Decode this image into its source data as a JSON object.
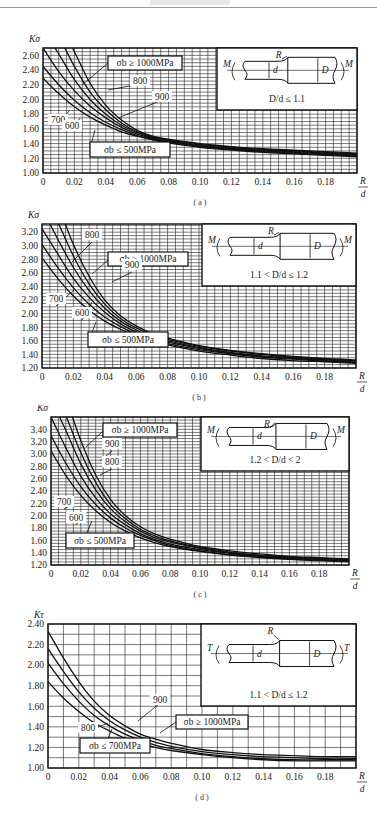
{
  "header": {
    "rule": true
  },
  "chart_data": [
    {
      "id": "a",
      "type": "line",
      "caption": "( a )",
      "ylabel": "Kσ",
      "xlabel": "R/d",
      "xlim": [
        0,
        0.2
      ],
      "ylim": [
        1.0,
        2.7
      ],
      "yticks": [
        "1.00",
        "1.20",
        "1.40",
        "1.60",
        "1.80",
        "2.00",
        "2.20",
        "2.40",
        "2.60"
      ],
      "xticks": [
        "0",
        "0.02",
        "0.04",
        "0.06",
        "0.08",
        "0.10",
        "0.12",
        "0.14",
        "0.16",
        "0.18"
      ],
      "grid": true,
      "inset": {
        "load": "M",
        "condition": "D/d ≤ 1.1"
      },
      "x": [
        0,
        0.01,
        0.02,
        0.03,
        0.04,
        0.05,
        0.06,
        0.07,
        0.08,
        0.1,
        0.12,
        0.14,
        0.16,
        0.18,
        0.2
      ],
      "series": [
        {
          "name": "σb ≤ 500MPa",
          "values": [
            2.29,
            2.08,
            1.9,
            1.76,
            1.65,
            1.56,
            1.5,
            1.45,
            1.41,
            1.35,
            1.31,
            1.28,
            1.26,
            1.24,
            1.22
          ]
        },
        {
          "name": "600",
          "values": [
            2.45,
            2.2,
            1.99,
            1.82,
            1.69,
            1.59,
            1.51,
            1.46,
            1.42,
            1.36,
            1.32,
            1.29,
            1.27,
            1.25,
            1.23
          ]
        },
        {
          "name": "700",
          "values": [
            2.7,
            2.38,
            2.12,
            1.91,
            1.75,
            1.62,
            1.53,
            1.47,
            1.43,
            1.37,
            1.33,
            1.3,
            1.28,
            1.26,
            1.24
          ]
        },
        {
          "name": "800",
          "values": [
            2.95,
            2.62,
            2.27,
            2.0,
            1.8,
            1.65,
            1.55,
            1.48,
            1.44,
            1.38,
            1.34,
            1.31,
            1.29,
            1.27,
            1.25
          ]
        },
        {
          "name": "900",
          "values": [
            3.15,
            2.85,
            2.45,
            2.1,
            1.86,
            1.68,
            1.56,
            1.49,
            1.45,
            1.39,
            1.35,
            1.32,
            1.3,
            1.28,
            1.26
          ]
        },
        {
          "name": "σb ≥ 1000MPa",
          "values": [
            3.35,
            3.05,
            2.65,
            2.22,
            1.92,
            1.72,
            1.58,
            1.5,
            1.46,
            1.4,
            1.36,
            1.33,
            1.31,
            1.29,
            1.27
          ]
        }
      ],
      "labels": {
        "top": "σb ≥ 1000MPa",
        "bottom": "σb ≤ 500MPa",
        "mid": [
          "800",
          "900",
          "700",
          "600"
        ]
      }
    },
    {
      "id": "b",
      "type": "line",
      "caption": "( b )",
      "ylabel": "Kσ",
      "xlabel": "R/d",
      "xlim": [
        0,
        0.2
      ],
      "ylim": [
        1.2,
        3.32
      ],
      "yticks": [
        "1.20",
        "1.40",
        "1.60",
        "1.80",
        "2.00",
        "2.20",
        "2.40",
        "2.60",
        "2.80",
        "3.00",
        "3.20"
      ],
      "xticks": [
        "0",
        "0.02",
        "0.04",
        "0.06",
        "0.08",
        "0.10",
        "0.12",
        "0.14",
        "0.16",
        "0.18"
      ],
      "grid": true,
      "inset": {
        "load": "M",
        "condition": "1.1 < D/d ≤ 1.2"
      },
      "x": [
        0,
        0.01,
        0.02,
        0.03,
        0.04,
        0.05,
        0.06,
        0.07,
        0.08,
        0.1,
        0.12,
        0.14,
        0.16,
        0.18,
        0.2
      ],
      "series": [
        {
          "name": "σb ≤ 500MPa",
          "values": [
            2.82,
            2.52,
            2.26,
            2.05,
            1.89,
            1.77,
            1.67,
            1.6,
            1.54,
            1.45,
            1.39,
            1.34,
            1.31,
            1.29,
            1.27
          ]
        },
        {
          "name": "600",
          "values": [
            3.02,
            2.68,
            2.38,
            2.14,
            1.95,
            1.81,
            1.7,
            1.62,
            1.56,
            1.47,
            1.41,
            1.36,
            1.33,
            1.3,
            1.28
          ]
        },
        {
          "name": "700",
          "values": [
            3.25,
            2.88,
            2.52,
            2.24,
            2.02,
            1.85,
            1.73,
            1.64,
            1.58,
            1.49,
            1.42,
            1.37,
            1.34,
            1.31,
            1.29
          ]
        },
        {
          "name": "800",
          "values": [
            3.55,
            3.1,
            2.68,
            2.34,
            2.08,
            1.89,
            1.76,
            1.66,
            1.6,
            1.5,
            1.43,
            1.38,
            1.35,
            1.32,
            1.3
          ]
        },
        {
          "name": "900",
          "values": [
            3.8,
            3.35,
            2.85,
            2.44,
            2.14,
            1.93,
            1.79,
            1.69,
            1.62,
            1.52,
            1.45,
            1.4,
            1.36,
            1.33,
            1.31
          ]
        },
        {
          "name": "σb ≥ 1000MPa",
          "values": [
            4.05,
            3.6,
            3.02,
            2.55,
            2.2,
            1.97,
            1.82,
            1.71,
            1.64,
            1.53,
            1.46,
            1.41,
            1.37,
            1.34,
            1.32
          ]
        }
      ],
      "labels": {
        "top": "σb ≥ 1000MPa",
        "bottom": "σb ≤ 500MPa",
        "mid": [
          "800",
          "900",
          "700",
          "600"
        ]
      }
    },
    {
      "id": "c",
      "type": "line",
      "caption": "( c )",
      "ylabel": "Kσ",
      "xlabel": "R/d",
      "xlim": [
        0,
        0.2
      ],
      "ylim": [
        1.2,
        3.6
      ],
      "yticks": [
        "1.20",
        "1.40",
        "1.60",
        "1.80",
        "2.00",
        "2.20",
        "2.40",
        "2.60",
        "2.80",
        "3.00",
        "3.20",
        "3.40"
      ],
      "xticks": [
        "0",
        "0.02",
        "0.04",
        "0.06",
        "0.08",
        "0.10",
        "0.12",
        "0.14",
        "0.16",
        "0.18"
      ],
      "grid": true,
      "inset": {
        "load": "M",
        "condition": "1.2 < D/d < 2"
      },
      "x": [
        0,
        0.01,
        0.02,
        0.03,
        0.04,
        0.05,
        0.06,
        0.07,
        0.08,
        0.1,
        0.12,
        0.14,
        0.16,
        0.18,
        0.2
      ],
      "series": [
        {
          "name": "σb ≤ 500MPa",
          "values": [
            3.05,
            2.65,
            2.33,
            2.08,
            1.89,
            1.75,
            1.64,
            1.56,
            1.5,
            1.42,
            1.36,
            1.32,
            1.29,
            1.27,
            1.25
          ]
        },
        {
          "name": "600",
          "values": [
            3.3,
            2.85,
            2.47,
            2.18,
            1.96,
            1.8,
            1.68,
            1.59,
            1.52,
            1.43,
            1.37,
            1.33,
            1.3,
            1.28,
            1.26
          ]
        },
        {
          "name": "700",
          "values": [
            3.6,
            3.1,
            2.64,
            2.29,
            2.03,
            1.85,
            1.71,
            1.61,
            1.54,
            1.45,
            1.39,
            1.34,
            1.31,
            1.29,
            1.27
          ]
        },
        {
          "name": "800",
          "values": [
            3.9,
            3.38,
            2.84,
            2.42,
            2.11,
            1.9,
            1.75,
            1.64,
            1.57,
            1.47,
            1.4,
            1.35,
            1.32,
            1.3,
            1.28
          ]
        },
        {
          "name": "900",
          "values": [
            4.2,
            3.62,
            3.02,
            2.54,
            2.18,
            1.95,
            1.78,
            1.67,
            1.59,
            1.48,
            1.41,
            1.36,
            1.33,
            1.31,
            1.29
          ]
        },
        {
          "name": "σb ≥ 1000MPa",
          "values": [
            4.5,
            3.9,
            3.22,
            2.66,
            2.26,
            2.0,
            1.82,
            1.7,
            1.62,
            1.5,
            1.43,
            1.38,
            1.34,
            1.32,
            1.3
          ]
        }
      ],
      "labels": {
        "top": "σb ≥ 1000MPa",
        "bottom": "σb ≤ 500MPa",
        "mid": [
          "900",
          "800",
          "700",
          "600"
        ]
      }
    },
    {
      "id": "d",
      "type": "line",
      "caption": "( d )",
      "ylabel": "Kτ",
      "xlabel": "R/d",
      "xlim": [
        0,
        0.2
      ],
      "ylim": [
        1.0,
        2.4
      ],
      "yticks": [
        "1.00",
        "1.20",
        "1.40",
        "1.60",
        "1.80",
        "2.00",
        "2.20",
        "2.40"
      ],
      "xticks": [
        "0",
        "0.02",
        "0.04",
        "0.06",
        "0.08",
        "0.10",
        "0.12",
        "0.14",
        "0.16",
        "0.18"
      ],
      "grid": true,
      "inset": {
        "load": "T",
        "condition": "1.1 < D/d ≤ 1.2"
      },
      "x": [
        0,
        0.01,
        0.02,
        0.03,
        0.04,
        0.05,
        0.06,
        0.07,
        0.08,
        0.1,
        0.12,
        0.14,
        0.16,
        0.18,
        0.2
      ],
      "series": [
        {
          "name": "σb ≤ 700MPa",
          "values": [
            1.84,
            1.68,
            1.55,
            1.44,
            1.36,
            1.29,
            1.24,
            1.2,
            1.17,
            1.13,
            1.1,
            1.08,
            1.07,
            1.07,
            1.07
          ]
        },
        {
          "name": "800",
          "values": [
            2.02,
            1.82,
            1.65,
            1.51,
            1.41,
            1.33,
            1.27,
            1.22,
            1.19,
            1.14,
            1.11,
            1.09,
            1.08,
            1.08,
            1.08
          ]
        },
        {
          "name": "900",
          "values": [
            2.16,
            1.94,
            1.74,
            1.58,
            1.46,
            1.37,
            1.3,
            1.25,
            1.21,
            1.16,
            1.13,
            1.11,
            1.1,
            1.09,
            1.09
          ]
        },
        {
          "name": "σb ≥ 1000MPa",
          "values": [
            2.33,
            2.07,
            1.84,
            1.65,
            1.51,
            1.41,
            1.33,
            1.28,
            1.24,
            1.18,
            1.15,
            1.13,
            1.12,
            1.11,
            1.11
          ]
        }
      ],
      "labels": {
        "top": "σb ≥ 1000MPa",
        "bottom": "σb ≤ 700MPa",
        "mid": [
          "900",
          "800"
        ]
      }
    }
  ]
}
